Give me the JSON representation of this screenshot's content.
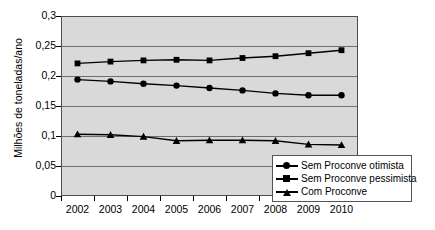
{
  "chart_data": {
    "type": "line",
    "title": "",
    "xlabel": "",
    "ylabel": "Milhões de toneladas/ano",
    "categories": [
      "2002",
      "2003",
      "2004",
      "2005",
      "2006",
      "2007",
      "2008",
      "2009",
      "2010"
    ],
    "ylim": [
      0,
      0.3
    ],
    "yticks": [
      "0",
      "0,05",
      "0,1",
      "0,15",
      "0,2",
      "0,25",
      "0,3"
    ],
    "ytick_values": [
      0,
      0.05,
      0.1,
      0.15,
      0.2,
      0.25,
      0.3
    ],
    "grid": true,
    "legend_position": "bottom-right",
    "plot_background": "#d9d9d9",
    "series": [
      {
        "name": "Sem Proconve otimista",
        "marker": "circle",
        "color": "#000000",
        "values": [
          0.194,
          0.191,
          0.187,
          0.184,
          0.18,
          0.176,
          0.171,
          0.168,
          0.168
        ]
      },
      {
        "name": "Sem Proconve pessimista",
        "marker": "square",
        "color": "#000000",
        "values": [
          0.221,
          0.224,
          0.226,
          0.227,
          0.226,
          0.23,
          0.233,
          0.238,
          0.243
        ]
      },
      {
        "name": "Com Proconve",
        "marker": "triangle",
        "color": "#000000",
        "values": [
          0.103,
          0.102,
          0.099,
          0.092,
          0.093,
          0.093,
          0.092,
          0.086,
          0.085
        ]
      }
    ]
  },
  "legend": {
    "items": [
      {
        "label": "Sem Proconve otimista",
        "marker": "circle"
      },
      {
        "label": "Sem Proconve pessimista",
        "marker": "square"
      },
      {
        "label": "Com Proconve",
        "marker": "triangle"
      }
    ]
  }
}
